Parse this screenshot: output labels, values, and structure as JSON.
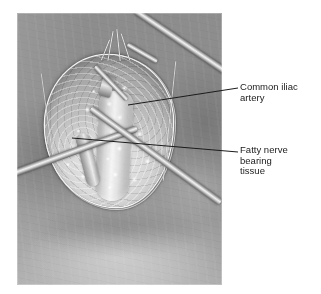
{
  "figure": {
    "name": "surgical-photograph-figure",
    "type": "annotated surgical photograph",
    "modality": "grayscale intraoperative photograph",
    "background_color": "#ffffff"
  },
  "photo": {
    "name": "intraoperative-photo",
    "alt": "Grayscale intraoperative photograph of an open surgical wound with retracted skin edges exposing fatty tissue and a vascular structure, with metal retractors and forceps entering the field",
    "base_tone": "#9d9d9d",
    "wound_tone": "#dcdcdc"
  },
  "annotations": {
    "leader_color": "#1b1b1b",
    "items": [
      {
        "id": "common-iliac-artery",
        "label": "Common iliac\nartery",
        "lines": [
          "Common iliac",
          "artery"
        ],
        "leader": {
          "x1": 128,
          "y1": 105,
          "x2": 238,
          "y2": 88
        }
      },
      {
        "id": "fatty-nerve-bearing-tissue",
        "label": "Fatty nerve\nbearing\ntissue",
        "lines": [
          "Fatty nerve",
          "bearing",
          "tissue"
        ],
        "leader": {
          "x1": 72,
          "y1": 138,
          "x2": 238,
          "y2": 152
        }
      }
    ]
  },
  "instruments": [
    {
      "id": "upper-right-retractor",
      "kind": "metal retractor",
      "enters_from": "top-right"
    },
    {
      "id": "left-retractor",
      "kind": "metal retractor",
      "enters_from": "left"
    },
    {
      "id": "lower-right-forceps",
      "kind": "metal forceps",
      "enters_from": "bottom-right"
    },
    {
      "id": "center-dissector",
      "kind": "metal dissector tip",
      "enters_from": "center"
    }
  ]
}
